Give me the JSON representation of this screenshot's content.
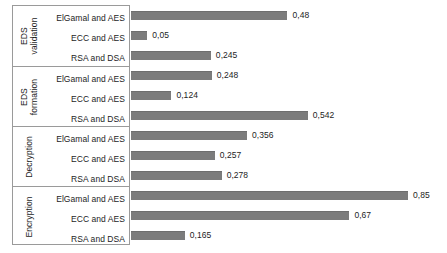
{
  "chart_data": {
    "type": "bar",
    "orientation": "horizontal",
    "title": "",
    "xlabel": "",
    "ylabel": "",
    "xlim": [
      0,
      0.97
    ],
    "grid": false,
    "legend": "none",
    "decimal_separator": ",",
    "bar_color": "#7c7c7c",
    "groups": [
      {
        "name": "EDS validation",
        "label_lines": [
          "EDS",
          "validation"
        ],
        "categories": [
          "ElGamal and AES",
          "ECC and AES",
          "RSA and DSA"
        ],
        "values": [
          0.48,
          0.05,
          0.245
        ],
        "value_labels": [
          "0,48",
          "0,05",
          "0,245"
        ]
      },
      {
        "name": "EDS formation",
        "label_lines": [
          "EDS",
          "formation"
        ],
        "categories": [
          "ElGamal and AES",
          "ECC and AES",
          "RSA and DSA"
        ],
        "values": [
          0.248,
          0.124,
          0.542
        ],
        "value_labels": [
          "0,248",
          "0,124",
          "0,542"
        ]
      },
      {
        "name": "Decryption",
        "label_lines": [
          "Decryption"
        ],
        "categories": [
          "ElGamal and AES",
          "ECC and AES",
          "RSA and DSA"
        ],
        "values": [
          0.356,
          0.257,
          0.278
        ],
        "value_labels": [
          "0,356",
          "0,257",
          "0,278"
        ]
      },
      {
        "name": "Encryption",
        "label_lines": [
          "Encryption"
        ],
        "categories": [
          "ElGamal and AES",
          "ECC and AES",
          "RSA and DSA"
        ],
        "values": [
          0.85,
          0.67,
          0.165
        ],
        "value_labels": [
          "0,85",
          "0,67",
          "0,165"
        ]
      }
    ]
  }
}
